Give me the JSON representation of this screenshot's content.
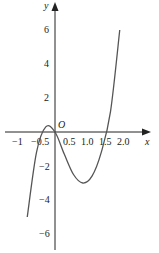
{
  "chart_data": {
    "type": "line",
    "title": "",
    "xlabel": "x",
    "ylabel": "y",
    "origin_label": "O",
    "x_ticks": [
      "−1",
      "−0.5",
      "0.5",
      "1.0",
      "1.5",
      "2.0"
    ],
    "y_ticks": [
      "6",
      "4",
      "2",
      "−2",
      "−4",
      "−6"
    ],
    "xlim": [
      -1.4,
      2.4
    ],
    "ylim": [
      -7.5,
      7.5
    ],
    "grid": false,
    "series": [
      {
        "name": "f(x)",
        "x": [
          -0.75,
          -0.5,
          -0.25,
          0,
          0.25,
          0.5,
          0.75,
          1.0,
          1.25,
          1.5,
          1.75
        ],
        "y": [
          -5.0,
          -1.2,
          0.3,
          0.0,
          -1.3,
          -2.5,
          -3.0,
          -2.6,
          -1.2,
          1.2,
          6.0
        ]
      }
    ],
    "annotations": {
      "local_max": {
        "x": -0.25,
        "y": 0.3
      },
      "local_min": {
        "x": 0.8,
        "y": -3.0
      }
    }
  }
}
